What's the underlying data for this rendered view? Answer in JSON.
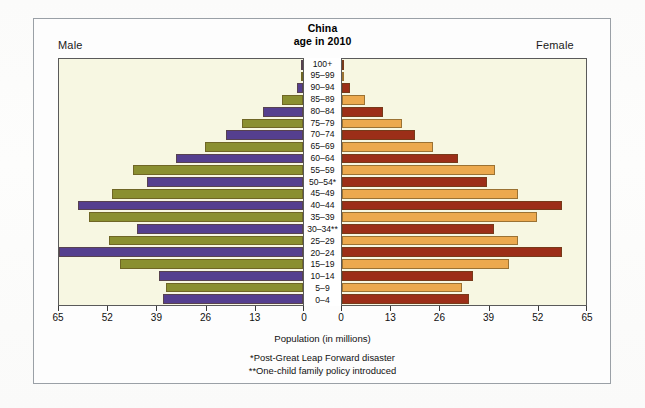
{
  "figure": {
    "title_line1": "China",
    "title_line2": "age in 2010",
    "male_label": "Male",
    "female_label": "Female",
    "axis_title": "Population (in millions)",
    "footnote_1": "*Post-Great Leap Forward disaster",
    "footnote_2": "**One-child family policy introduced"
  },
  "colors": {
    "male_a": "#553f8f",
    "male_b": "#8a8f30",
    "female_a": "#9c2e18",
    "female_b": "#eca94e",
    "panel_background": "#f7f7e2",
    "frame": "#9aa0a6",
    "axis": "#3a3a3a"
  },
  "chart_data": {
    "type": "bar",
    "subtype": "population-pyramid",
    "title": "China age in 2010",
    "xlabel": "Population (in millions)",
    "ylabel": "",
    "grid": false,
    "legend_position": "none",
    "xlim_left": [
      65,
      0
    ],
    "xlim_right": [
      0,
      65
    ],
    "xticks_left": [
      "65",
      "52",
      "39",
      "26",
      "13",
      "0"
    ],
    "xticks_right": [
      "0",
      "13",
      "26",
      "39",
      "52",
      "65"
    ],
    "xtick_values": [
      0,
      13,
      26,
      39,
      52,
      65
    ],
    "categories": [
      "0–4",
      "5–9",
      "10–14",
      "15–19",
      "20–24",
      "25–29",
      "30–34**",
      "35–39",
      "40–44",
      "45–49",
      "50–54*",
      "55–59",
      "60–64",
      "65–69",
      "70–74",
      "75–79",
      "80–84",
      "85–89",
      "90–94",
      "95–99",
      "100+"
    ],
    "series": [
      {
        "name": "Male",
        "side": "left",
        "values": [
          37.3,
          36.6,
          38.4,
          48.8,
          65.0,
          51.6,
          44.2,
          57.0,
          59.9,
          51.0,
          41.5,
          45.2,
          33.8,
          26.0,
          20.5,
          16.3,
          10.6,
          5.6,
          1.6,
          0.4,
          0.04
        ]
      },
      {
        "name": "Female",
        "side": "right",
        "values": [
          33.7,
          32.1,
          35.0,
          44.5,
          58.5,
          46.8,
          40.5,
          52.0,
          58.5,
          47.0,
          38.5,
          40.8,
          30.8,
          24.2,
          19.5,
          16.0,
          11.0,
          6.0,
          2.0,
          0.5,
          0.05
        ]
      }
    ],
    "annotations": [
      "*Post-Great Leap Forward disaster",
      "**One-child family policy introduced"
    ]
  }
}
